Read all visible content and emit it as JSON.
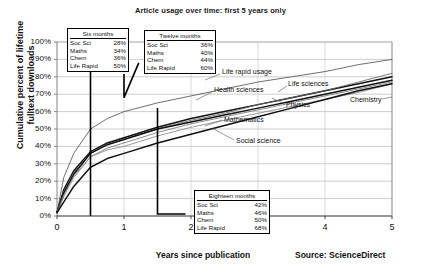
{
  "chart_data": {
    "type": "line",
    "title": "Article usage over time: first 5 years only",
    "xlabel": "Years since publication",
    "ylabel": "Cumulative percent of lifetime fulltext downloads",
    "ylabel_line1": "Cumulative percent of lifetime",
    "ylabel_line2": "fulltext downloads",
    "source": "Source: ScienceDirect",
    "xlim": [
      0,
      5
    ],
    "ylim": [
      0,
      100
    ],
    "grid": true,
    "legend": "inline-labels",
    "xticks": [
      "0",
      "1",
      "2",
      "3",
      "4",
      "5"
    ],
    "yticks": [
      "0%",
      "10%",
      "20%",
      "30%",
      "40%",
      "50%",
      "60%",
      "70%",
      "80%",
      "90%",
      "100%"
    ],
    "x": [
      0,
      0.1,
      0.25,
      0.5,
      0.75,
      1,
      1.5,
      2,
      2.5,
      3,
      3.5,
      4,
      4.5,
      5
    ],
    "series": [
      {
        "name": "Life rapid usage",
        "values": [
          2,
          22,
          36,
          50,
          56,
          60,
          65,
          69,
          73,
          77,
          80,
          83,
          87,
          90
        ]
      },
      {
        "name": "Health sciences",
        "values": [
          2,
          15,
          26,
          37,
          42,
          45,
          51,
          56,
          60,
          64,
          68,
          72,
          76,
          80
        ]
      },
      {
        "name": "Life sciences",
        "values": [
          2,
          14,
          25,
          36,
          41,
          44,
          50,
          55,
          59,
          64,
          68,
          72,
          77,
          82
        ]
      },
      {
        "name": "Chemistry",
        "values": [
          2,
          13,
          24,
          36,
          41,
          44,
          50,
          54,
          58,
          62,
          66,
          70,
          74,
          78
        ]
      },
      {
        "name": "Physics",
        "values": [
          2,
          12,
          23,
          34,
          39,
          42,
          48,
          53,
          57,
          61,
          65,
          69,
          73,
          77
        ]
      },
      {
        "name": "Mathematics",
        "values": [
          2,
          11,
          22,
          34,
          38,
          40,
          46,
          51,
          55,
          59,
          63,
          67,
          71,
          76
        ]
      },
      {
        "name": "Social science",
        "values": [
          2,
          8,
          17,
          28,
          33,
          36,
          42,
          47,
          52,
          57,
          62,
          67,
          72,
          76
        ]
      }
    ],
    "annotations": [
      {
        "title": "Six months",
        "at_x": 0.5,
        "rows": [
          {
            "label": "Soc Sci",
            "value": "28%"
          },
          {
            "label": "Maths",
            "value": "34%"
          },
          {
            "label": "Chem",
            "value": "36%"
          },
          {
            "label": "Life Rapid",
            "value": "50%"
          }
        ]
      },
      {
        "title": "Twelve months",
        "at_x": 1.0,
        "rows": [
          {
            "label": "Soc Sci",
            "value": "36%"
          },
          {
            "label": "Maths",
            "value": "40%"
          },
          {
            "label": "Chem",
            "value": "44%"
          },
          {
            "label": "Life Rapid",
            "value": "60%"
          }
        ]
      },
      {
        "title": "Eighteen months",
        "at_x": 1.5,
        "rows": [
          {
            "label": "Soc Sci",
            "value": "42%"
          },
          {
            "label": "Maths",
            "value": "46%"
          },
          {
            "label": "Chem",
            "value": "50%"
          },
          {
            "label": "Life Rapid",
            "value": "68%"
          }
        ]
      }
    ],
    "curve_labels": [
      "Life rapid usage",
      "Health sciences",
      "Life sciences",
      "Physics",
      "Chemistry",
      "Mathematics",
      "Social science"
    ]
  }
}
